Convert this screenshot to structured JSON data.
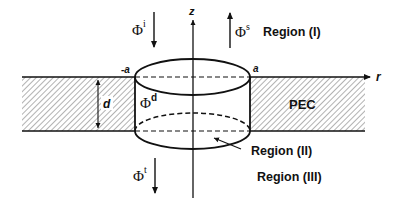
{
  "figure": {
    "axes": {
      "z_label": "z",
      "r_label": "r"
    },
    "cylinder": {
      "left_edge_label": "-a",
      "right_edge_label": "a",
      "thickness_label": "d",
      "inside_field_base": "Φ",
      "inside_field_sup": "d"
    },
    "fields": {
      "incident": {
        "base": "Φ",
        "sup": "i",
        "direction": "down"
      },
      "scattered": {
        "base": "Φ",
        "sup": "s",
        "direction": "up"
      },
      "transmitted": {
        "base": "Φ",
        "sup": "t",
        "direction": "down"
      }
    },
    "regions": {
      "region_1": "Region (I)",
      "region_2": "Region (II)",
      "region_3": "Region (III)"
    },
    "material_label": "PEC",
    "colors": {
      "stroke": "#111111",
      "background": "#ffffff",
      "hatch": "#555555"
    }
  }
}
